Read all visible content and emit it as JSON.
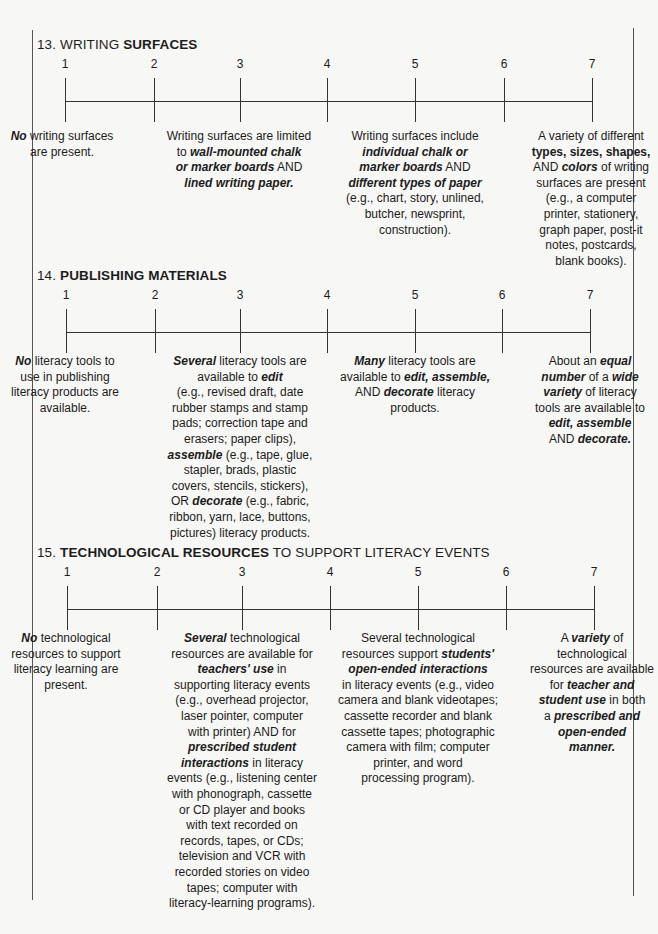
{
  "sections": [
    {
      "number": "13.",
      "title_parts": [
        {
          "text": "WRITING ",
          "bold": false
        },
        {
          "text": "SURFACES",
          "bold": true
        }
      ],
      "scale": [
        "1",
        "2",
        "3",
        "4",
        "5",
        "6",
        "7"
      ],
      "descriptors": [
        {
          "anchor": "1",
          "text": [
            [
              {
                "t": "No",
                "s": "bi"
              },
              {
                "t": " writing surfaces"
              }
            ],
            [
              {
                "t": "are present."
              }
            ]
          ]
        },
        {
          "anchor": "3",
          "text": [
            [
              {
                "t": "Writing surfaces are limited"
              }
            ],
            [
              {
                "t": "to "
              },
              {
                "t": "wall-mounted chalk",
                "s": "bi"
              }
            ],
            [
              {
                "t": "or marker boards",
                "s": "bi"
              },
              {
                "t": " AND"
              }
            ],
            [
              {
                "t": "lined writing paper.",
                "s": "bi"
              }
            ]
          ]
        },
        {
          "anchor": "5",
          "text": [
            [
              {
                "t": "Writing surfaces include"
              }
            ],
            [
              {
                "t": "individual chalk or",
                "s": "bi"
              }
            ],
            [
              {
                "t": "marker boards",
                "s": "bi"
              },
              {
                "t": " AND"
              }
            ],
            [
              {
                "t": "different types of paper",
                "s": "bi"
              }
            ],
            [
              {
                "t": "(e.g., chart, story, unlined,"
              }
            ],
            [
              {
                "t": "butcher, newsprint,"
              }
            ],
            [
              {
                "t": "construction)."
              }
            ]
          ]
        },
        {
          "anchor": "7",
          "text": [
            [
              {
                "t": "A variety of different"
              }
            ],
            [
              {
                "t": "types, sizes, shapes,",
                "s": "b"
              }
            ],
            [
              {
                "t": "AND "
              },
              {
                "t": "colors",
                "s": "bi"
              },
              {
                "t": " of writing"
              }
            ],
            [
              {
                "t": "surfaces are present"
              }
            ],
            [
              {
                "t": "(e.g., a computer"
              }
            ],
            [
              {
                "t": "printer, stationery,"
              }
            ],
            [
              {
                "t": "graph paper, post-it"
              }
            ],
            [
              {
                "t": "notes, postcards,"
              }
            ],
            [
              {
                "t": "blank books)."
              }
            ]
          ]
        }
      ]
    },
    {
      "number": "14.",
      "title_parts": [
        {
          "text": "PUBLISHING MATERIALS",
          "bold": true
        }
      ],
      "scale": [
        "1",
        "2",
        "3",
        "4",
        "5",
        "6",
        "7"
      ],
      "descriptors": [
        {
          "anchor": "1",
          "text": [
            [
              {
                "t": "No",
                "s": "bi"
              },
              {
                "t": " literacy tools to"
              }
            ],
            [
              {
                "t": "use in publishing"
              }
            ],
            [
              {
                "t": "literacy products are"
              }
            ],
            [
              {
                "t": "available."
              }
            ]
          ]
        },
        {
          "anchor": "3",
          "text": [
            [
              {
                "t": "Several",
                "s": "bi"
              },
              {
                "t": " literacy tools are"
              }
            ],
            [
              {
                "t": "available to "
              },
              {
                "t": "edit",
                "s": "bi"
              }
            ],
            [
              {
                "t": "(e.g., revised draft, date"
              }
            ],
            [
              {
                "t": "rubber stamps and stamp"
              }
            ],
            [
              {
                "t": "pads; correction tape and"
              }
            ],
            [
              {
                "t": "erasers; paper clips),"
              }
            ],
            [
              {
                "t": "assemble",
                "s": "bi"
              },
              {
                "t": " (e.g., tape, glue,"
              }
            ],
            [
              {
                "t": "stapler, brads, plastic"
              }
            ],
            [
              {
                "t": "covers, stencils, stickers),"
              }
            ],
            [
              {
                "t": "OR "
              },
              {
                "t": "decorate",
                "s": "bi"
              },
              {
                "t": " (e.g., fabric,"
              }
            ],
            [
              {
                "t": "ribbon, yarn, lace, buttons,"
              }
            ],
            [
              {
                "t": "pictures) literacy products."
              }
            ]
          ]
        },
        {
          "anchor": "5",
          "text": [
            [
              {
                "t": "Many",
                "s": "bi"
              },
              {
                "t": " literacy tools are"
              }
            ],
            [
              {
                "t": "available to "
              },
              {
                "t": "edit, assemble,",
                "s": "bi"
              }
            ],
            [
              {
                "t": "AND "
              },
              {
                "t": "decorate",
                "s": "bi"
              },
              {
                "t": " literacy"
              }
            ],
            [
              {
                "t": "products."
              }
            ]
          ]
        },
        {
          "anchor": "7",
          "text": [
            [
              {
                "t": "About an "
              },
              {
                "t": "equal",
                "s": "bi"
              }
            ],
            [
              {
                "t": "number",
                "s": "bi"
              },
              {
                "t": " of a "
              },
              {
                "t": "wide",
                "s": "bi"
              }
            ],
            [
              {
                "t": "variety",
                "s": "bi"
              },
              {
                "t": " of literacy"
              }
            ],
            [
              {
                "t": "tools are available to"
              }
            ],
            [
              {
                "t": "edit, assemble",
                "s": "bi"
              }
            ],
            [
              {
                "t": "AND "
              },
              {
                "t": "decorate.",
                "s": "bi"
              }
            ]
          ]
        }
      ]
    },
    {
      "number": "15.",
      "title_parts": [
        {
          "text": "TECHNOLOGICAL RESOURCES",
          "bold": true
        },
        {
          "text": " TO SUPPORT LITERACY EVENTS",
          "bold": false
        }
      ],
      "scale": [
        "1",
        "2",
        "3",
        "4",
        "5",
        "6",
        "7"
      ],
      "descriptors": [
        {
          "anchor": "1",
          "text": [
            [
              {
                "t": "No",
                "s": "bi"
              },
              {
                "t": " technological"
              }
            ],
            [
              {
                "t": "resources to support"
              }
            ],
            [
              {
                "t": "literacy learning are"
              }
            ],
            [
              {
                "t": "present."
              }
            ]
          ]
        },
        {
          "anchor": "3",
          "text": [
            [
              {
                "t": "Several",
                "s": "bi"
              },
              {
                "t": " technological"
              }
            ],
            [
              {
                "t": "resources are available for"
              }
            ],
            [
              {
                "t": "teachers' use",
                "s": "bi"
              },
              {
                "t": " in"
              }
            ],
            [
              {
                "t": "supporting literacy events"
              }
            ],
            [
              {
                "t": "(e.g., overhead projector,"
              }
            ],
            [
              {
                "t": "laser pointer, computer"
              }
            ],
            [
              {
                "t": "with printer) AND for"
              }
            ],
            [
              {
                "t": "prescribed student",
                "s": "bi"
              }
            ],
            [
              {
                "t": "interactions",
                "s": "bi"
              },
              {
                "t": " in literacy"
              }
            ],
            [
              {
                "t": "events (e.g., listening center"
              }
            ],
            [
              {
                "t": "with phonograph, cassette"
              }
            ],
            [
              {
                "t": "or CD player and books"
              }
            ],
            [
              {
                "t": "with text recorded on"
              }
            ],
            [
              {
                "t": "records, tapes, or CDs;"
              }
            ],
            [
              {
                "t": "television and VCR with"
              }
            ],
            [
              {
                "t": "recorded stories on video"
              }
            ],
            [
              {
                "t": "tapes; computer with"
              }
            ],
            [
              {
                "t": "literacy-learning programs)."
              }
            ]
          ]
        },
        {
          "anchor": "5",
          "text": [
            [
              {
                "t": "Several technological"
              }
            ],
            [
              {
                "t": "resources support "
              },
              {
                "t": "students'",
                "s": "bi"
              }
            ],
            [
              {
                "t": "open-ended interactions",
                "s": "bi"
              }
            ],
            [
              {
                "t": "in literacy events (e.g., video"
              }
            ],
            [
              {
                "t": "camera and blank videotapes;"
              }
            ],
            [
              {
                "t": "cassette recorder and blank"
              }
            ],
            [
              {
                "t": "cassette tapes; photographic"
              }
            ],
            [
              {
                "t": "camera with film; computer"
              }
            ],
            [
              {
                "t": "printer, and word"
              }
            ],
            [
              {
                "t": "processing program)."
              }
            ]
          ]
        },
        {
          "anchor": "7",
          "text": [
            [
              {
                "t": "A "
              },
              {
                "t": "variety",
                "s": "bi"
              },
              {
                "t": " of"
              }
            ],
            [
              {
                "t": "technological"
              }
            ],
            [
              {
                "t": "resources are available"
              }
            ],
            [
              {
                "t": "for "
              },
              {
                "t": "teacher and",
                "s": "bi"
              }
            ],
            [
              {
                "t": "student use",
                "s": "bi"
              },
              {
                "t": " in both"
              }
            ],
            [
              {
                "t": "a "
              },
              {
                "t": "prescribed and",
                "s": "bi"
              }
            ],
            [
              {
                "t": "open-ended",
                "s": "bi"
              }
            ],
            [
              {
                "t": "manner.",
                "s": "bi"
              }
            ]
          ]
        }
      ]
    }
  ]
}
